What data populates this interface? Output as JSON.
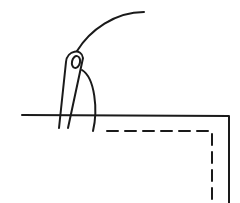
{
  "illustration": {
    "subject": "needle and thread sewing along fabric edge",
    "colors": {
      "stroke": "#1a1a1a",
      "background": "#ffffff"
    }
  }
}
